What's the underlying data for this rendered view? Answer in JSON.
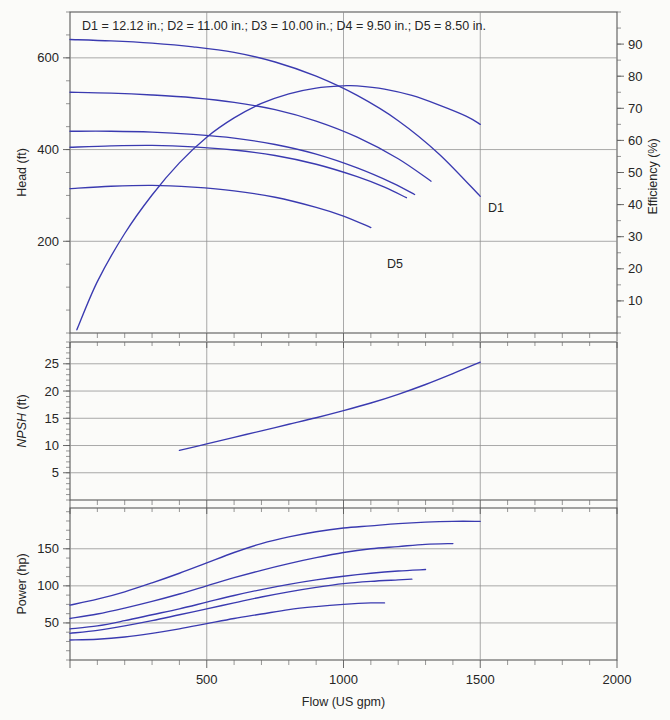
{
  "figure": {
    "title": "D1 = 12.12 in.; D2 = 11.00 in.; D3 = 10.00 in.; D4 = 9.50 in.; D5 = 8.50 in.",
    "curve_color": "#3a3ab0",
    "grid_color": "#8e8e8e",
    "axis_color": "#5a5a5a",
    "background": "#fbfbf9"
  },
  "labels": {
    "head_axis": "Head (ft)",
    "efficiency_axis": "Efficiency (%)",
    "npsh_axis_italic": "NPSH",
    "npsh_axis_unit": " (ft)",
    "power_axis": "Power (hp)",
    "flow_axis": "Flow (US gpm)",
    "curve_d1": "D1",
    "curve_d5": "D5"
  },
  "axes": {
    "flow_ticks": [
      "500",
      "1000",
      "1500",
      "2000"
    ],
    "flow_tick_values": [
      500,
      1000,
      1500,
      2000
    ],
    "flow_range": [
      0,
      2000
    ],
    "head_ticks": [
      "200",
      "400",
      "600"
    ],
    "head_tick_values": [
      200,
      400,
      600
    ],
    "head_range": [
      0,
      700
    ],
    "efficiency_ticks": [
      "10",
      "20",
      "30",
      "40",
      "50",
      "60",
      "70",
      "80",
      "90"
    ],
    "efficiency_tick_values": [
      10,
      20,
      30,
      40,
      50,
      60,
      70,
      80,
      90
    ],
    "efficiency_range": [
      0,
      100
    ],
    "npsh_ticks": [
      "5",
      "10",
      "15",
      "20",
      "25"
    ],
    "npsh_tick_values": [
      5,
      10,
      15,
      20,
      25
    ],
    "npsh_range": [
      0,
      29
    ],
    "power_ticks": [
      "50",
      "100",
      "150"
    ],
    "power_tick_values": [
      50,
      100,
      150
    ],
    "power_range": [
      0,
      205
    ]
  },
  "chart_data": [
    {
      "type": "line",
      "title": "D1 = 12.12 in.; D2 = 11.00 in.; D3 = 10.00 in.; D4 = 9.50 in.; D5 = 8.50 in.",
      "panel": "head-efficiency",
      "xlabel": "Flow (US gpm)",
      "ylabel": "Head (ft)",
      "y2label": "Efficiency (%)",
      "xlim": [
        0,
        2000
      ],
      "ylim": [
        0,
        700
      ],
      "y2lim": [
        0,
        100
      ],
      "grid": true,
      "legend": "inline-curve-labels",
      "series": [
        {
          "name": "D1",
          "axis": "left",
          "x": [
            0,
            150,
            300,
            450,
            600,
            750,
            900,
            1050,
            1200,
            1350,
            1500
          ],
          "y": [
            640,
            637,
            632,
            624,
            612,
            591,
            560,
            518,
            463,
            390,
            298
          ]
        },
        {
          "name": "D2",
          "axis": "left",
          "x": [
            0,
            150,
            300,
            450,
            600,
            750,
            900,
            1050,
            1200,
            1320
          ],
          "y": [
            525,
            523,
            519,
            513,
            503,
            487,
            462,
            427,
            380,
            331
          ]
        },
        {
          "name": "D3",
          "axis": "left",
          "x": [
            0,
            150,
            300,
            450,
            600,
            750,
            900,
            1050,
            1180,
            1260
          ],
          "y": [
            440,
            440,
            438,
            433,
            425,
            411,
            390,
            360,
            327,
            302
          ]
        },
        {
          "name": "D4",
          "axis": "left",
          "x": [
            0,
            150,
            300,
            450,
            600,
            750,
            900,
            1050,
            1150,
            1230
          ],
          "y": [
            405,
            408,
            409,
            406,
            399,
            387,
            368,
            341,
            318,
            295
          ]
        },
        {
          "name": "D5",
          "axis": "left",
          "x": [
            0,
            150,
            300,
            450,
            600,
            750,
            900,
            1000,
            1100
          ],
          "y": [
            315,
            320,
            322,
            318,
            310,
            296,
            274,
            255,
            230
          ]
        },
        {
          "name": "Efficiency",
          "axis": "right",
          "x": [
            25,
            100,
            200,
            300,
            400,
            500,
            600,
            700,
            800,
            900,
            1000,
            1050,
            1150,
            1250,
            1350,
            1450,
            1500
          ],
          "y": [
            1,
            16,
            31,
            43,
            53,
            61,
            67,
            71.5,
            74.5,
            76.3,
            77,
            77,
            76,
            74,
            71,
            67.5,
            65
          ]
        }
      ]
    },
    {
      "type": "line",
      "panel": "npsh",
      "xlabel": "Flow (US gpm)",
      "ylabel": "NPSH (ft)",
      "xlim": [
        0,
        2000
      ],
      "ylim": [
        0,
        29
      ],
      "grid": true,
      "series": [
        {
          "name": "NPSH",
          "x": [
            400,
            500,
            600,
            700,
            800,
            900,
            1000,
            1100,
            1200,
            1300,
            1400,
            1500
          ],
          "y": [
            9.1,
            10.3,
            11.5,
            12.7,
            13.9,
            15.1,
            16.4,
            17.8,
            19.4,
            21.2,
            23.2,
            25.3
          ]
        }
      ]
    },
    {
      "type": "line",
      "panel": "power",
      "xlabel": "Flow (US gpm)",
      "ylabel": "Power (hp)",
      "xlim": [
        0,
        2000
      ],
      "ylim": [
        0,
        205
      ],
      "grid": true,
      "series": [
        {
          "name": "D1",
          "x": [
            0,
            100,
            200,
            300,
            400,
            500,
            600,
            700,
            800,
            900,
            1000,
            1100,
            1200,
            1300,
            1400,
            1500
          ],
          "y": [
            74,
            82,
            92,
            104,
            117,
            131,
            145,
            157,
            166,
            173,
            178,
            181,
            184,
            186,
            187,
            187
          ]
        },
        {
          "name": "D2",
          "x": [
            0,
            100,
            200,
            300,
            400,
            500,
            600,
            700,
            800,
            900,
            1000,
            1100,
            1200,
            1300,
            1400
          ],
          "y": [
            56,
            62,
            70,
            79,
            89,
            100,
            111,
            121,
            130,
            138,
            145,
            150,
            153,
            156,
            157
          ]
        },
        {
          "name": "D3",
          "x": [
            0,
            100,
            200,
            300,
            400,
            500,
            600,
            700,
            800,
            900,
            1000,
            1100,
            1200,
            1300
          ],
          "y": [
            42,
            46,
            53,
            61,
            69,
            78,
            87,
            95,
            102,
            108,
            113,
            117,
            120,
            122
          ]
        },
        {
          "name": "D4",
          "x": [
            0,
            100,
            200,
            300,
            400,
            500,
            600,
            700,
            800,
            900,
            1000,
            1100,
            1200,
            1250
          ],
          "y": [
            36,
            40,
            46,
            53,
            61,
            69,
            77,
            85,
            92,
            98,
            103,
            106,
            108,
            109
          ]
        },
        {
          "name": "D5",
          "x": [
            0,
            100,
            200,
            300,
            400,
            500,
            600,
            700,
            800,
            900,
            1000,
            1100,
            1150
          ],
          "y": [
            27,
            28,
            31,
            36,
            42,
            49,
            56,
            62,
            68,
            72,
            75,
            77,
            77
          ]
        }
      ]
    }
  ]
}
